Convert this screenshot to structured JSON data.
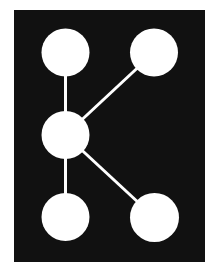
{
  "figure": {
    "background": "#ffffff",
    "frame_color": "#111111",
    "node_color": "#ffffff",
    "edge_color": "#ffffff",
    "edge_width": 3,
    "nodes": [
      {
        "id": "top-left",
        "cx": 65.5,
        "cy": 52.5,
        "r": 24
      },
      {
        "id": "top-right",
        "cx": 154,
        "cy": 52.5,
        "r": 24
      },
      {
        "id": "middle",
        "cx": 65.5,
        "cy": 135,
        "r": 24
      },
      {
        "id": "bottom-left",
        "cx": 65.5,
        "cy": 217,
        "r": 24
      },
      {
        "id": "bottom-right",
        "cx": 154.5,
        "cy": 217.5,
        "r": 24.5
      }
    ],
    "edges": [
      {
        "from": "top-left",
        "to": "middle"
      },
      {
        "from": "middle",
        "to": "bottom-left"
      },
      {
        "from": "middle",
        "to": "top-right"
      },
      {
        "from": "middle",
        "to": "bottom-right"
      }
    ]
  }
}
